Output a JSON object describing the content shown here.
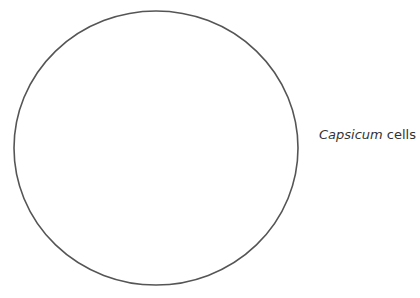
{
  "diagram": {
    "shape": {
      "type": "ellipse",
      "cx": 156,
      "cy": 148,
      "rx": 142,
      "ry": 137,
      "stroke": "#555555",
      "stroke_width": 1.6,
      "fill": "none"
    },
    "label": {
      "species": "Capsicum",
      "suffix": " cells"
    }
  }
}
